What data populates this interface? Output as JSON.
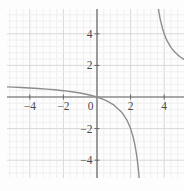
{
  "chart_data": {
    "type": "line",
    "title": "",
    "xlabel": "",
    "ylabel": "",
    "expression": "y = x / (x - 3)",
    "vertical_asymptote_x": 3,
    "horizontal_asymptote_y": 1,
    "xlim": [
      -5.4,
      5.2
    ],
    "ylim": [
      -5.15,
      5.62
    ],
    "grid": {
      "on": true,
      "major_step": 2,
      "minor_divisions": 5
    },
    "legend": "none",
    "x_ticks": [
      {
        "value": -4,
        "label": "−4"
      },
      {
        "value": -2,
        "label": "−2"
      },
      {
        "value": 0,
        "label": "0"
      },
      {
        "value": 2,
        "label": "2"
      },
      {
        "value": 4,
        "label": "4"
      }
    ],
    "y_ticks": [
      {
        "value": 4,
        "label": "4"
      },
      {
        "value": 2,
        "label": "2"
      },
      {
        "value": -2,
        "label": "−2"
      },
      {
        "value": -4,
        "label": "−4"
      }
    ],
    "series": [
      {
        "name": "branch-left-of-asymptote",
        "points": [
          [
            -5.4,
            0.643
          ],
          [
            -5.0,
            0.625
          ],
          [
            -4.5,
            0.6
          ],
          [
            -4.0,
            0.571
          ],
          [
            -3.5,
            0.538
          ],
          [
            -3.0,
            0.5
          ],
          [
            -2.5,
            0.455
          ],
          [
            -2.0,
            0.4
          ],
          [
            -1.5,
            0.333
          ],
          [
            -1.0,
            0.25
          ],
          [
            -0.5,
            0.143
          ],
          [
            0.0,
            0.0
          ],
          [
            0.5,
            -0.2
          ],
          [
            1.0,
            -0.5
          ],
          [
            1.5,
            -1.0
          ],
          [
            1.8,
            -1.5
          ],
          [
            2.0,
            -2.0
          ],
          [
            2.143,
            -2.5
          ],
          [
            2.25,
            -3.0
          ],
          [
            2.333,
            -3.5
          ],
          [
            2.4,
            -4.0
          ],
          [
            2.455,
            -4.5
          ],
          [
            2.5,
            -5.0
          ],
          [
            2.513,
            -5.15
          ]
        ]
      },
      {
        "name": "branch-right-of-asymptote",
        "points": [
          [
            3.649,
            5.62
          ],
          [
            3.7,
            5.286
          ],
          [
            3.75,
            5.0
          ],
          [
            3.8,
            4.75
          ],
          [
            3.9,
            4.333
          ],
          [
            4.0,
            4.0
          ],
          [
            4.1,
            3.727
          ],
          [
            4.2,
            3.5
          ],
          [
            4.4,
            3.143
          ],
          [
            4.6,
            2.875
          ],
          [
            4.8,
            2.667
          ],
          [
            5.0,
            2.5
          ],
          [
            5.2,
            2.364
          ]
        ]
      }
    ],
    "colors": {
      "background": "#fdfdfd",
      "minor_grid": "#ededed",
      "major_grid": "#d8d8d8",
      "axis": "#666666",
      "tick_label": "#4a4a4a",
      "curve": "#8d8d8d"
    }
  }
}
